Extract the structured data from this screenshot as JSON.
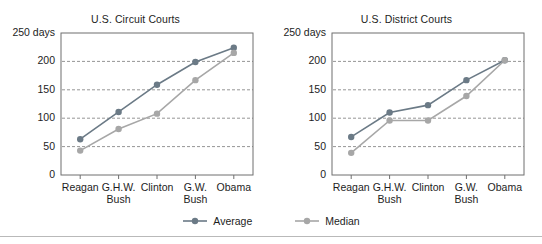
{
  "chart_data": [
    {
      "type": "line",
      "title": "U.S. Circuit Courts",
      "xlabel": "",
      "ylabel": "250 days",
      "yunit_label": "250 days",
      "categories": [
        "Reagan",
        "G.H.W. Bush",
        "Clinton",
        "G.W. Bush",
        "Obama"
      ],
      "category_lines": [
        [
          "Reagan"
        ],
        [
          "G.H.W.",
          "Bush"
        ],
        [
          "Clinton"
        ],
        [
          "G.W.",
          "Bush"
        ],
        [
          "Obama"
        ]
      ],
      "yticks": [
        0,
        50,
        100,
        150,
        200,
        250
      ],
      "ytick_labels": [
        "0",
        "50",
        "100",
        "150",
        "200",
        "250 days"
      ],
      "ylim": [
        0,
        250
      ],
      "grid": "horizontal-dashed",
      "legend_position": "bottom-center",
      "series": [
        {
          "name": "Average",
          "color": "#6b7a86",
          "values": [
            63,
            111,
            159,
            199,
            224
          ]
        },
        {
          "name": "Median",
          "color": "#a7a7a7",
          "values": [
            43,
            81,
            108,
            167,
            215
          ]
        }
      ]
    },
    {
      "type": "line",
      "title": "U.S. District Courts",
      "xlabel": "",
      "ylabel": "250 days",
      "yunit_label": "250 days",
      "categories": [
        "Reagan",
        "G.H.W. Bush",
        "Clinton",
        "G.W. Bush",
        "Obama"
      ],
      "category_lines": [
        [
          "Reagan"
        ],
        [
          "G.H.W.",
          "Bush"
        ],
        [
          "Clinton"
        ],
        [
          "G.W.",
          "Bush"
        ],
        [
          "Obama"
        ]
      ],
      "yticks": [
        0,
        50,
        100,
        150,
        200,
        250
      ],
      "ytick_labels": [
        "0",
        "50",
        "100",
        "150",
        "200",
        "250 days"
      ],
      "ylim": [
        0,
        250
      ],
      "grid": "horizontal-dashed",
      "legend_position": "bottom-center",
      "series": [
        {
          "name": "Average",
          "color": "#6b7a86",
          "values": [
            67,
            110,
            123,
            167,
            202
          ]
        },
        {
          "name": "Median",
          "color": "#a7a7a7",
          "values": [
            39,
            96,
            96,
            139,
            202
          ]
        }
      ]
    }
  ],
  "legend": {
    "items": [
      {
        "label": "Average",
        "color": "#6b7a86"
      },
      {
        "label": "Median",
        "color": "#a7a7a7"
      }
    ]
  },
  "colors": {
    "average": "#6b7a86",
    "median": "#a7a7a7",
    "axis": "#6f6f6f",
    "grid": "#7a7a7a",
    "text": "#1d1d1d",
    "rule": "#b9b9b9",
    "background": "#ffffff"
  }
}
